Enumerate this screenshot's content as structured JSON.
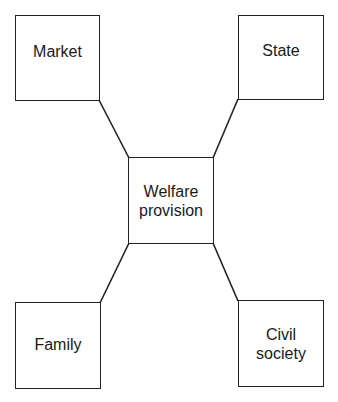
{
  "diagram": {
    "center": {
      "label_line1": "Welfare",
      "label_line2": "provision"
    },
    "nodes": [
      {
        "id": "market",
        "label": "Market",
        "position": "top-left"
      },
      {
        "id": "state",
        "label": "State",
        "position": "top-right"
      },
      {
        "id": "family",
        "label": "Family",
        "position": "bottom-left"
      },
      {
        "id": "civil-society",
        "label_line1": "Civil",
        "label_line2": "society",
        "position": "bottom-right"
      }
    ],
    "edges": [
      {
        "from": "market",
        "to": "welfare-provision"
      },
      {
        "from": "state",
        "to": "welfare-provision"
      },
      {
        "from": "family",
        "to": "welfare-provision"
      },
      {
        "from": "civil-society",
        "to": "welfare-provision"
      }
    ],
    "colors": {
      "stroke": "#222222",
      "background": "#ffffff",
      "text": "#1a1a1a"
    }
  }
}
